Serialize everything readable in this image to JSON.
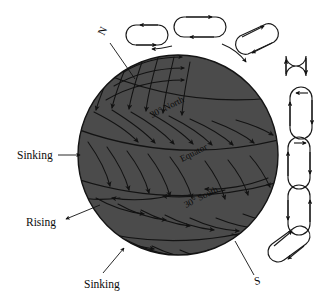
{
  "figure": {
    "background_color": "#ffffff",
    "globe_color": "#4b4b4b",
    "line_color": "#121212"
  },
  "globe": {
    "center_x": 178,
    "center_y": 155,
    "radius": 101,
    "latitude_labels": [
      {
        "id": "lat-30-north",
        "text": "30° North",
        "x": 152,
        "y": 118,
        "rotation": -27
      },
      {
        "id": "lat-equator",
        "text": "Equator",
        "x": 182,
        "y": 162,
        "rotation": -27
      },
      {
        "id": "lat-30-south",
        "text": "30° South",
        "x": 186,
        "y": 208,
        "rotation": -27
      }
    ]
  },
  "poles": [
    {
      "id": "north-pole",
      "text": "N",
      "x": 104,
      "y": 36,
      "rotation": -65
    },
    {
      "id": "south-pole",
      "text": "S",
      "x": 258,
      "y": 283,
      "rotation": -12
    }
  ],
  "callouts": [
    {
      "id": "callout-sinking-north",
      "text": "Sinking",
      "x": 17,
      "y": 159
    },
    {
      "id": "callout-rising",
      "text": "Rising",
      "x": 26,
      "y": 222
    },
    {
      "id": "callout-sinking-south",
      "text": "Sinking",
      "x": 84,
      "y": 285
    }
  ],
  "circulation_cells": {
    "count": 9,
    "description": "Rounded-rectangle convection loops with directional arrowheads arranged around the upper-right limb of the globe"
  }
}
